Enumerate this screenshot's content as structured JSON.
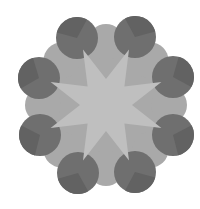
{
  "figure": {
    "type": "geometric-rosette",
    "center": [
      106,
      105
    ],
    "colors": {
      "background": "#ffffff",
      "circle": "#6f6f6f",
      "circle_shade": "#626262",
      "octagon": "#a9a9a9",
      "star": "#bfbfbf"
    },
    "circles": [
      {
        "cx": 77,
        "cy": 38,
        "r": 21
      },
      {
        "cx": 135,
        "cy": 37,
        "r": 21
      },
      {
        "cx": 173,
        "cy": 77,
        "r": 21
      },
      {
        "cx": 173,
        "cy": 135,
        "r": 21
      },
      {
        "cx": 135,
        "cy": 172,
        "r": 21
      },
      {
        "cx": 78,
        "cy": 173,
        "r": 21
      },
      {
        "cx": 40,
        "cy": 135,
        "r": 21
      },
      {
        "cx": 39,
        "cy": 78,
        "r": 21
      }
    ],
    "star": {
      "points": 8,
      "outer_r": 60,
      "inner_r": 26
    },
    "lobes": {
      "count": 8,
      "radius": 78,
      "lobe_r": 18
    }
  }
}
